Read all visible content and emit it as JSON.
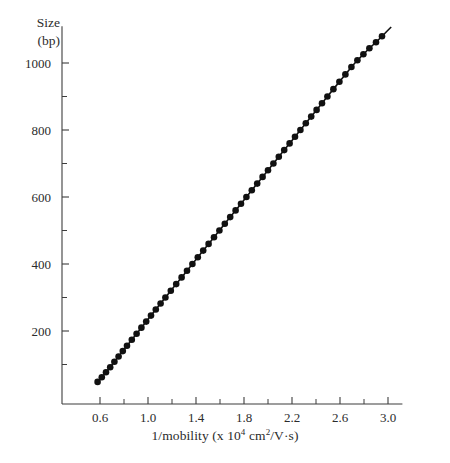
{
  "figure": {
    "background": "#ffffff",
    "foreground": "#2b2b2b",
    "marker_color": "#111111"
  },
  "axis_titles": {
    "y_line1": "Size",
    "y_line2": "(bp)",
    "x_prefix": "1/mobility (x 10",
    "x_exp1": "4",
    "x_mid": " cm",
    "x_exp2": "2",
    "x_suffix": "/V·s)"
  },
  "chart_data": {
    "type": "scatter",
    "title": "",
    "subtitle": "",
    "xlabel": "1/mobility (x 10^4 cm^2/V·s)",
    "ylabel": "Size (bp)",
    "xlim": [
      0.42,
      3.12
    ],
    "ylim": [
      0,
      1110
    ],
    "grid": false,
    "legend": null,
    "x_ticks": [
      0.6,
      1.0,
      1.4,
      1.8,
      2.2,
      2.6,
      3.0
    ],
    "x_tick_labels": [
      "0.6",
      "1.0",
      "1.4",
      "1.8",
      "2.2",
      "2.6",
      "3.0"
    ],
    "x_minor_ticks": [
      0.8,
      1.2,
      1.6,
      2.0,
      2.4,
      2.8
    ],
    "y_ticks": [
      200,
      400,
      600,
      800,
      1000
    ],
    "y_tick_labels": [
      "200",
      "400",
      "600",
      "800",
      "1000"
    ],
    "y_minor_ticks": [
      100,
      300,
      500,
      700,
      900
    ],
    "series": [
      {
        "name": "DNA fragment size vs inverse mobility",
        "marker": "filled-circle",
        "marker_size": 3.3,
        "line": true,
        "x": [
          0.58,
          0.615,
          0.65,
          0.685,
          0.72,
          0.755,
          0.79,
          0.825,
          0.865,
          0.905,
          0.945,
          0.985,
          1.025,
          1.065,
          1.105,
          1.145,
          1.19,
          1.235,
          1.28,
          1.325,
          1.37,
          1.415,
          1.46,
          1.505,
          1.55,
          1.595,
          1.64,
          1.685,
          1.73,
          1.775,
          1.82,
          1.865,
          1.91,
          1.955,
          2.0,
          2.045,
          2.09,
          2.135,
          2.18,
          2.225,
          2.27,
          2.315,
          2.36,
          2.405,
          2.45,
          2.495,
          2.545,
          2.595,
          2.645,
          2.695,
          2.745,
          2.795,
          2.845,
          2.9,
          2.95
        ],
        "y": [
          48,
          62,
          77,
          92,
          108,
          124,
          140,
          156,
          174,
          192,
          210,
          228,
          246,
          264,
          282,
          300,
          320,
          340,
          360,
          380,
          400,
          420,
          440,
          460,
          480,
          500,
          520,
          540,
          560,
          580,
          600,
          620,
          640,
          660,
          680,
          700,
          720,
          740,
          760,
          780,
          800,
          820,
          840,
          860,
          880,
          900,
          922,
          944,
          966,
          988,
          1008,
          1026,
          1044,
          1062,
          1080
        ]
      }
    ],
    "fit": {
      "type": "linear",
      "note": "near-linear relationship between fragment size and inverse mobility"
    }
  }
}
